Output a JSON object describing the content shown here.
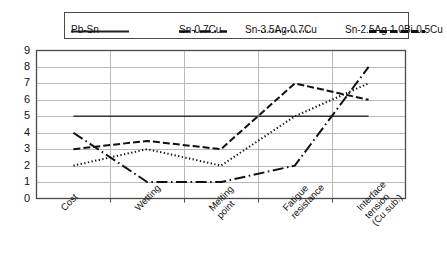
{
  "chart_data": {
    "type": "line",
    "title": "",
    "xlabel": "",
    "ylabel": "",
    "ylim": [
      0,
      9
    ],
    "ytick_values": [
      0,
      1,
      2,
      3,
      4,
      5,
      6,
      7,
      8,
      9
    ],
    "grid": true,
    "legend_position": "top",
    "categories": [
      "Cost",
      "Wetting",
      "Melting\npoint",
      "Fatigue\nresistance",
      "Interface\ntension\n(Cu sub.)"
    ],
    "series": [
      {
        "name": "Pb-Sn",
        "style": "solid",
        "color": "#333333",
        "values": [
          5,
          5,
          5,
          5,
          5
        ]
      },
      {
        "name": "Sn-0.7Cu",
        "style": "dash-dot",
        "color": "#111111",
        "values": [
          4,
          1,
          1,
          2,
          8
        ]
      },
      {
        "name": "Sn-3.5Ag-0.7Cu",
        "style": "dotted",
        "color": "#111111",
        "values": [
          2,
          3,
          2,
          5,
          7
        ]
      },
      {
        "name": "Sn-2.5Ag-1.0Bi-0.5Cu",
        "style": "dashed",
        "color": "#111111",
        "values": [
          3,
          3.5,
          3,
          7,
          6
        ]
      }
    ]
  },
  "legend": {
    "entries": [
      {
        "label": "Pb-Sn",
        "style": "solid"
      },
      {
        "label": "Sn-0.7Cu",
        "style": "dash-dot"
      },
      {
        "label": "Sn-3.5Ag-0.7Cu",
        "style": "dotted"
      },
      {
        "label": "Sn-2.5Ag-1.0Bi-0.5Cu",
        "style": "dashed"
      }
    ]
  },
  "axes": {
    "y_ticks": [
      "0",
      "1",
      "2",
      "3",
      "4",
      "5",
      "6",
      "7",
      "8",
      "9"
    ],
    "x_ticks": [
      "Cost",
      "Wetting",
      "Melting\npoint",
      "Fatigue\nresistance",
      "Interface\ntension\n(Cu sub.)"
    ]
  },
  "colors": {
    "axis": "#4a4a4a",
    "grid": "#b9b9b9",
    "series": "#111111",
    "background": "#ffffff"
  }
}
